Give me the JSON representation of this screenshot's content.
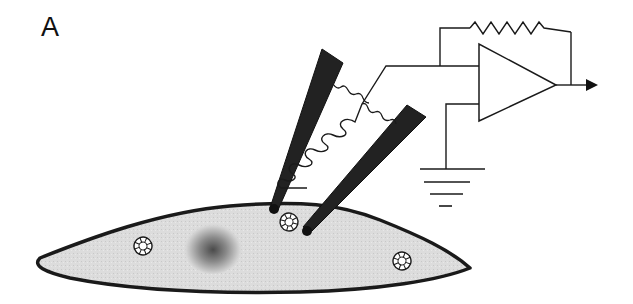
{
  "panel": {
    "label": "A",
    "title": "Patch-clamp recording setup with two electrodes on a cell and an operational amplifier circuit"
  },
  "colors": {
    "line": "#1a1a1a",
    "electrode_fill": "#222222",
    "cell_fill": "#dcdcdc",
    "nucleus_core": "#555555",
    "background": "#ffffff"
  },
  "components": [
    {
      "name": "cell",
      "description": "elongated spindle-shaped cell body"
    },
    {
      "name": "nucleus",
      "description": "dark shaded circle in cell center"
    },
    {
      "name": "organelles",
      "count": 3
    },
    {
      "name": "electrode-left",
      "description": "recording pipette touching cell membrane"
    },
    {
      "name": "electrode-right",
      "description": "second pipette penetrating cell"
    },
    {
      "name": "coil-inductor",
      "description": "coiled wire between electrodes"
    },
    {
      "name": "wavy-connections",
      "count": 2
    },
    {
      "name": "op-amp",
      "description": "operational amplifier triangle"
    },
    {
      "name": "feedback-resistor",
      "description": "zigzag resistor in feedback loop"
    },
    {
      "name": "ground-symbol",
      "description": "ground connection at non-inverting input"
    },
    {
      "name": "output-arrow",
      "description": "arrow indicating amplifier output"
    }
  ]
}
